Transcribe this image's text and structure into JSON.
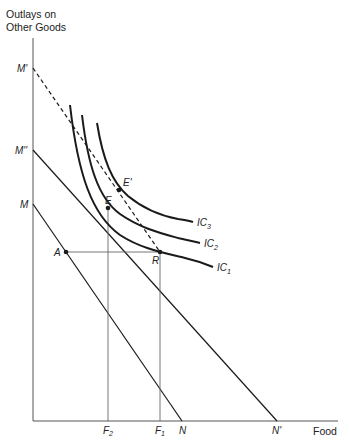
{
  "axes": {
    "y_label_line1": "Outlays on",
    "y_label_line2": "Other Goods",
    "x_label": "Food"
  },
  "y_intercepts": {
    "M_prime": "M'",
    "M_double_prime": "M''",
    "M": "M"
  },
  "x_intercepts": {
    "F2": "F",
    "F2_sub": "2",
    "F1": "F",
    "F1_sub": "1",
    "N": "N",
    "N_prime": "N'"
  },
  "points": {
    "A": "A",
    "E": "E",
    "E_prime": "E'",
    "R": "R"
  },
  "curves": {
    "IC1": "IC",
    "IC1_sub": "1",
    "IC2": "IC",
    "IC2_sub": "2",
    "IC3": "IC",
    "IC3_sub": "3"
  },
  "colors": {
    "line": "#1a1a1a",
    "axis": "#555555",
    "guide": "#666666"
  }
}
